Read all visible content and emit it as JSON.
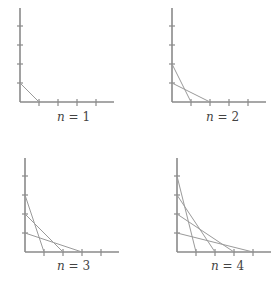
{
  "panels": [
    {
      "n": 1,
      "label": "n = 1",
      "label_var": "n",
      "label_eq": " = 1",
      "origin": [
        20,
        102
      ],
      "segments": [
        [
          0,
          1,
          1,
          0
        ]
      ]
    },
    {
      "n": 2,
      "label": "n = 2",
      "label_var": "n",
      "label_eq": " = 2",
      "origin": [
        172,
        102
      ],
      "segments": [
        [
          0,
          2,
          1,
          0
        ],
        [
          0,
          1,
          2,
          0
        ]
      ]
    },
    {
      "n": 3,
      "label": "n = 3",
      "label_var": "n",
      "label_eq": " = 3",
      "origin": [
        25,
        252
      ],
      "segments": [
        [
          0,
          3,
          1,
          0
        ],
        [
          0,
          2,
          2,
          0
        ],
        [
          0,
          1,
          3,
          0
        ]
      ]
    },
    {
      "n": 4,
      "label": "n = 4",
      "label_var": "n",
      "label_eq": " = 4",
      "origin": [
        177,
        252
      ],
      "segments": [
        [
          0,
          4,
          1,
          0
        ],
        [
          0,
          3,
          2,
          0
        ],
        [
          0,
          2,
          3,
          0
        ],
        [
          0,
          1,
          4,
          0
        ]
      ]
    }
  ],
  "tick_spacing": 19,
  "ticks_per_axis": 4,
  "colors": {
    "axis": "#8a8a8a",
    "line": "#9a9a9a",
    "text": "#444444"
  }
}
